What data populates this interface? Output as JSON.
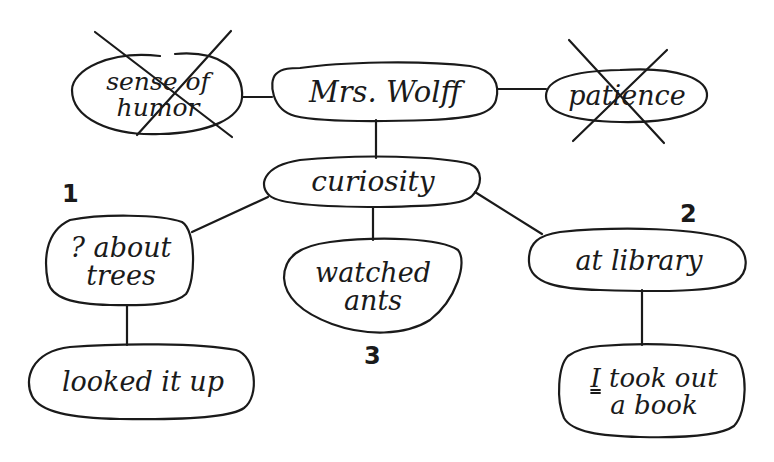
{
  "diagram": {
    "type": "concept web",
    "ink_color": "#1a1a1a",
    "background": "#ffffff",
    "center": {
      "text": "Mrs. Wolff"
    },
    "nodes": {
      "sense_of_humor": {
        "line1": "sense of",
        "line2": "humor",
        "crossed_out": true
      },
      "mrs_wolff": {
        "text": "Mrs. Wolff"
      },
      "patience": {
        "text": "patience",
        "crossed_out": true
      },
      "curiosity": {
        "text": "curiosity"
      },
      "about_trees": {
        "line1": "? about",
        "line2": "trees",
        "number": "1"
      },
      "watched_ants": {
        "line1": "watched",
        "line2": "ants",
        "number": "3"
      },
      "at_library": {
        "text": "at library",
        "number": "2"
      },
      "looked_it_up": {
        "text": "looked it up"
      },
      "took_out_book": {
        "line1_prefix": "I",
        "line1_rest": " took out",
        "line2": "a book"
      }
    },
    "edges": [
      {
        "from": "sense_of_humor",
        "to": "mrs_wolff"
      },
      {
        "from": "mrs_wolff",
        "to": "patience"
      },
      {
        "from": "mrs_wolff",
        "to": "curiosity"
      },
      {
        "from": "curiosity",
        "to": "about_trees"
      },
      {
        "from": "curiosity",
        "to": "watched_ants"
      },
      {
        "from": "curiosity",
        "to": "at_library"
      },
      {
        "from": "about_trees",
        "to": "looked_it_up"
      },
      {
        "from": "at_library",
        "to": "took_out_book"
      }
    ]
  }
}
